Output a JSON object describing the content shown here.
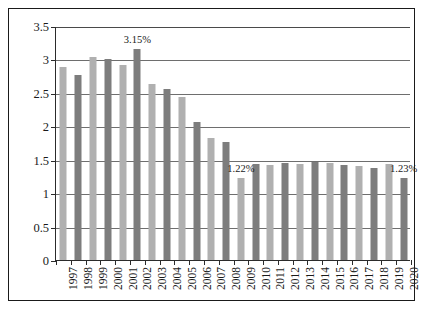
{
  "chart_data": {
    "type": "bar",
    "title": "",
    "subtitle": "",
    "xlabel": "",
    "ylabel": "",
    "ylim": [
      0,
      3.5
    ],
    "ytick_step": 0.5,
    "yticks": [
      "3.5",
      "3",
      "2.5",
      "2",
      "1.5",
      "1",
      "0.5",
      "0"
    ],
    "ytick_values": [
      3.5,
      3,
      2.5,
      2,
      1.5,
      1,
      0.5,
      0
    ],
    "grid": true,
    "legend": "none",
    "categories": [
      "1997",
      "1998",
      "1999",
      "2000",
      "2001",
      "2002",
      "2003",
      "2004",
      "2005",
      "2006",
      "2007",
      "2008",
      "2009",
      "2010",
      "2011",
      "2012",
      "2013",
      "2014",
      "2015",
      "2016",
      "2017",
      "2018",
      "2019",
      "2020"
    ],
    "values": [
      2.89,
      2.76,
      3.03,
      3.01,
      2.91,
      3.15,
      2.63,
      2.56,
      2.44,
      2.07,
      1.82,
      1.76,
      1.22,
      1.44,
      1.42,
      1.45,
      1.43,
      1.46,
      1.45,
      1.42,
      1.41,
      1.38,
      1.43,
      1.23
    ],
    "bar_colors": [
      "#b0b0b0",
      "#7d7d7d"
    ],
    "bar_color_pattern": "alternating-light-dark",
    "annotations": [
      {
        "category": "2002",
        "text": "3.15%",
        "value": 3.15
      },
      {
        "category": "2009",
        "text": "1.22%",
        "value": 1.22
      },
      {
        "category": "2020",
        "text": "1.23%",
        "value": 1.23
      }
    ]
  },
  "colors": {
    "frame_border": "#1a1a1a",
    "axis": "#2b2b2b",
    "gridline": "#6e6e6e",
    "bar_light": "#b0b0b0",
    "bar_dark": "#7d7d7d",
    "text": "#1a1a1a",
    "background": "#ffffff"
  }
}
